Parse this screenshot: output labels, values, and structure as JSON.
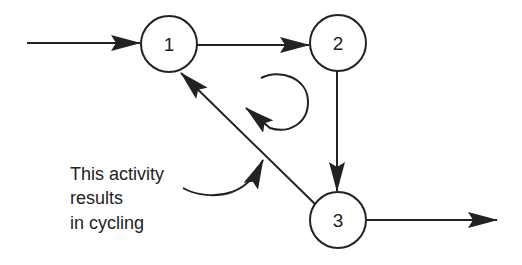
{
  "diagram": {
    "type": "directed-graph",
    "colors": {
      "stroke": "#222222",
      "background": "#ffffff"
    },
    "nodes": [
      {
        "id": "1",
        "label": "1",
        "cx": 169,
        "cy": 44,
        "r": 28
      },
      {
        "id": "2",
        "label": "2",
        "cx": 338,
        "cy": 43,
        "r": 28
      },
      {
        "id": "3",
        "label": "3",
        "cx": 338,
        "cy": 220,
        "r": 28
      }
    ],
    "edges": [
      {
        "from": "entry",
        "to": "1"
      },
      {
        "from": "1",
        "to": "2"
      },
      {
        "from": "2",
        "to": "3"
      },
      {
        "from": "3",
        "to": "1"
      },
      {
        "from": "3",
        "to": "exit"
      }
    ],
    "cycle_indicator": "clockwise-loop-arrow",
    "annotation": {
      "lines": [
        "This activity",
        "results",
        "in cycling"
      ],
      "points_to": "edge 3->1"
    }
  }
}
